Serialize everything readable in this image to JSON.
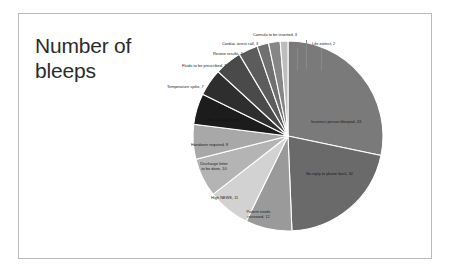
{
  "slide": {
    "title": "Number of bleeps"
  },
  "chart_data": {
    "type": "pie",
    "title": "Number of bleeps",
    "legend_position": "none",
    "label_format": "category, value",
    "total": 152,
    "categories": [
      "Incorrect person bleeped",
      "No reply to phone back",
      "Patient needs reviewed",
      "High NEWS",
      "Discharge letter to be done",
      "Handover required",
      "Jobs handed over",
      "Temperature spike",
      "Fluids to be prescribed",
      "Review results",
      "Cardiac arrest call",
      "Cannula to be inserted",
      "Life extinct"
    ],
    "values": [
      43,
      32,
      12,
      11,
      10,
      9,
      8,
      7,
      7,
      5,
      3,
      3,
      2
    ],
    "colors": [
      "#7a7a7a",
      "#6a6a6a",
      "#9a9a9a",
      "#d2d2d2",
      "#b4b4b4",
      "#a8a8a8",
      "#1c1c1c",
      "#2e2e2e",
      "#4a4a4a",
      "#5c5c5c",
      "#707070",
      "#868686",
      "#bdbdbd"
    ],
    "labels": [
      "Incorrect person bleeped, 43",
      "No reply to phone back, 32",
      "Patient needs reviewed, 12",
      "High NEWS, 11",
      "Discharge letter to be done, 10",
      "Handover required, 9",
      "Jobs handed over, 8",
      "Temperature spike, 7",
      "Fluids to be prescribed, 7",
      "Review results, 5",
      "Cardiac arrest call, 3",
      "Cannula to be inserted, 3",
      "Life extinct, 2"
    ]
  },
  "labels": {
    "incorrect_person": "Incorrect person bleeped, 43",
    "no_reply": "No reply to phone back, 32",
    "patient_needs_reviewed": "Patient needs reviewed, 12",
    "high_news": "High NEWS, 11",
    "discharge_letter": "Discharge letter to be done, 10",
    "handover_required": "Handover required, 9",
    "jobs_handed_over": "Jobs handed over, 8",
    "temperature_spike": "Temperature spike, 7",
    "fluids_prescribed": "Fluids to be prescribed, 7",
    "review_results": "Review results, 5",
    "cardiac_arrest": "Cardiac arrest call, 3",
    "cannula_inserted": "Cannula to be inserted, 3",
    "life_extinct": "Life extinct, 2"
  }
}
